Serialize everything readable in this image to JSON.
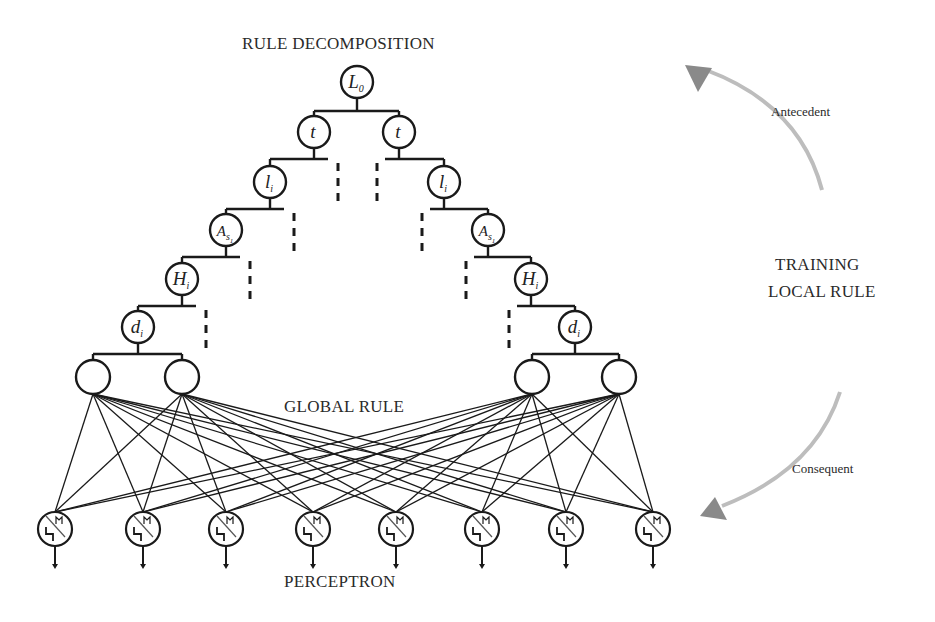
{
  "labels": {
    "rule_decomposition": "RULE  DECOMPOSITION",
    "global_rule": "GLOBAL RULE",
    "perceptron": "PERCEPTRON",
    "training_line1": "TRAINING",
    "training_line2": "LOCAL RULE",
    "antecedent": "Antecedent",
    "consequent": "Consequent"
  },
  "tree": {
    "root": {
      "symbol": "L",
      "sub": "0"
    },
    "left_chain": [
      {
        "symbol": "t",
        "sub": ""
      },
      {
        "symbol": "l",
        "sub": "i"
      },
      {
        "symbol": "A",
        "sub": "s1"
      },
      {
        "symbol": "H",
        "sub": "i"
      },
      {
        "symbol": "d",
        "sub": "i"
      }
    ],
    "right_chain": [
      {
        "symbol": "t",
        "sub": ""
      },
      {
        "symbol": "l",
        "sub": "i"
      },
      {
        "symbol": "A",
        "sub": "s1"
      },
      {
        "symbol": "H",
        "sub": "i"
      },
      {
        "symbol": "d",
        "sub": "i"
      }
    ]
  },
  "hidden_nodes_count": 4,
  "perceptron_count": 8,
  "colors": {
    "line": "#1a1a1a",
    "arrow_shaft": "#bdbdbd",
    "arrow_head": "#8a8a8a",
    "text": "#2a2a2a"
  }
}
